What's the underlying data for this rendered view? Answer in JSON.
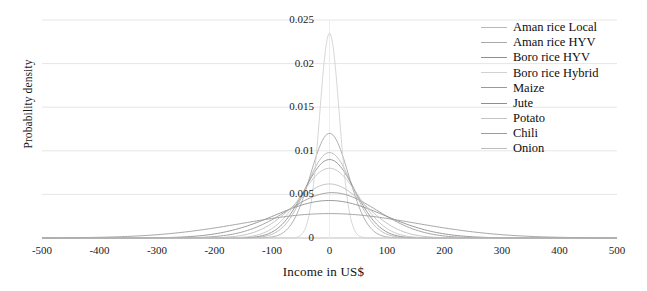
{
  "chart_data": {
    "type": "line",
    "title": "",
    "xlabel": "Income in US$",
    "ylabel": "Probability density",
    "xlim": [
      -500,
      500
    ],
    "ylim": [
      0,
      0.025
    ],
    "xticks": [
      -500,
      -400,
      -300,
      -200,
      -100,
      0,
      100,
      200,
      300,
      400,
      500
    ],
    "xtick_labels": [
      "-500",
      "-400",
      "-300",
      "-200",
      "-100",
      "0",
      "100",
      "200",
      "300",
      "400",
      "500"
    ],
    "yticks": [
      0,
      0.005,
      0.01,
      0.015,
      0.02,
      0.025
    ],
    "ytick_labels": [
      "0",
      "0.005",
      "0.01",
      "0.015",
      "0.02",
      "0.025"
    ],
    "grid": "horizontal",
    "legend_position": "top-right",
    "series": [
      {
        "name": "Aman rice Local",
        "peak_x": 0,
        "peak_y": 0.0098,
        "sigma": 40,
        "color": "#b9b9b9"
      },
      {
        "name": "Aman rice HYV",
        "peak_x": 0,
        "peak_y": 0.012,
        "sigma": 33,
        "color": "#a8a8a8"
      },
      {
        "name": "Boro rice HYV",
        "peak_x": 0,
        "peak_y": 0.009,
        "sigma": 44,
        "color": "#909090"
      },
      {
        "name": "Boro rice Hybrid",
        "peak_x": 0,
        "peak_y": 0.0235,
        "sigma": 17,
        "color": "#d2d2d2"
      },
      {
        "name": "Maize",
        "peak_x": 5,
        "peak_y": 0.0052,
        "sigma": 78,
        "color": "#9a9a9a"
      },
      {
        "name": "Jute",
        "peak_x": 0,
        "peak_y": 0.0043,
        "sigma": 95,
        "color": "#8f8f8f"
      },
      {
        "name": "Potato",
        "peak_x": 0,
        "peak_y": 0.008,
        "sigma": 50,
        "color": "#c4c4c4"
      },
      {
        "name": "Chili",
        "peak_x": 0,
        "peak_y": 0.0028,
        "sigma": 150,
        "color": "#9c9c9c"
      },
      {
        "name": "Onion",
        "peak_x": 0,
        "peak_y": 0.0062,
        "sigma": 62,
        "color": "#bdbdbd"
      }
    ]
  },
  "axes": {
    "y_title": "Probability density",
    "x_title": "Income in US$"
  },
  "legend": {
    "items": [
      {
        "label": "Aman rice Local"
      },
      {
        "label": "Aman rice HYV"
      },
      {
        "label": "Boro rice HYV"
      },
      {
        "label": "Boro rice Hybrid"
      },
      {
        "label": "Maize"
      },
      {
        "label": "Jute"
      },
      {
        "label": "Potato"
      },
      {
        "label": "Chili"
      },
      {
        "label": "Onion"
      }
    ]
  }
}
